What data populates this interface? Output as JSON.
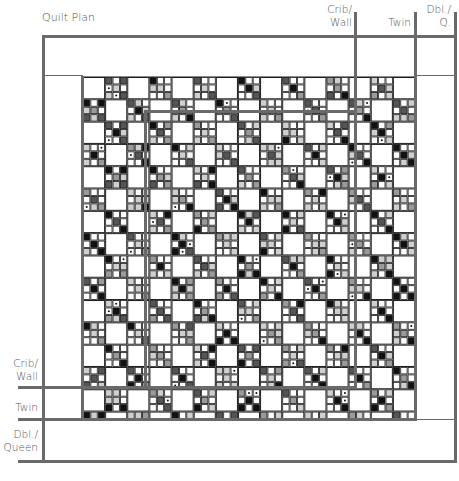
{
  "title": "Quilt Plan",
  "top_labels": [
    {
      "id": "crib-wall",
      "line1": "Crib/",
      "line2": "Wall"
    },
    {
      "id": "twin",
      "line1": "",
      "line2": "Twin"
    },
    {
      "id": "dbl-queen",
      "line1": "Dbl./",
      "line2": "Q."
    }
  ],
  "side_labels": [
    {
      "id": "crib-wall",
      "line1": "Crib/",
      "line2": "Wall"
    },
    {
      "id": "twin",
      "line1": "",
      "line2": "Twin"
    },
    {
      "id": "dbl-queen",
      "line1": "Dbl./",
      "line2": "Queen"
    }
  ],
  "grid": {
    "x": 83,
    "y": 77,
    "width": 332,
    "height": 342,
    "cols": 45,
    "rows": 46
  },
  "palette": {
    "frame": "#6a6a6a",
    "grid_line": "#1a1a1a",
    "black": "#111111",
    "dark": "#555555",
    "medium": "#9a9a9a",
    "light": "#cfcfcf",
    "white": "#ffffff"
  }
}
